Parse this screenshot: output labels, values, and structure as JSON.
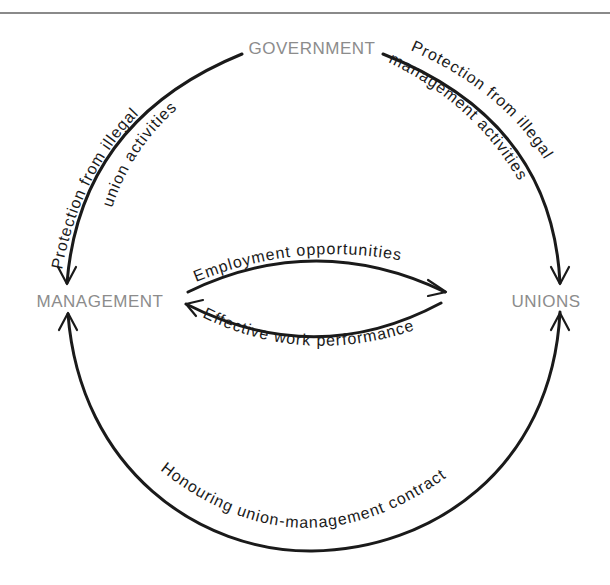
{
  "diagram": {
    "nodes": {
      "government": "GOVERNMENT",
      "management": "MANAGEMENT",
      "unions": "UNIONS"
    },
    "edges": [
      {
        "id": "gov-to-mgmt",
        "from": "GOVERNMENT",
        "to": "MANAGEMENT",
        "label_line1": "Protection from illegal",
        "label_line2": "union activities"
      },
      {
        "id": "gov-to-unions",
        "from": "GOVERNMENT",
        "to": "UNIONS",
        "label_line1": "Protection from illegal",
        "label_line2": "management activities"
      },
      {
        "id": "mgmt-to-unions",
        "from": "MANAGEMENT",
        "to": "UNIONS",
        "label_line1": "Employment opportunities"
      },
      {
        "id": "unions-to-mgmt",
        "from": "UNIONS",
        "to": "MANAGEMENT",
        "label_line1": "Effective work performance"
      },
      {
        "id": "contract",
        "from": "UNIONS",
        "to": "MANAGEMENT",
        "bidirectional": true,
        "label_line1": "Honouring union-management contract"
      }
    ],
    "colors": {
      "node_text": "#8c8c8c",
      "line": "#1a1a1a",
      "top_rule": "#8a8a8a"
    }
  }
}
